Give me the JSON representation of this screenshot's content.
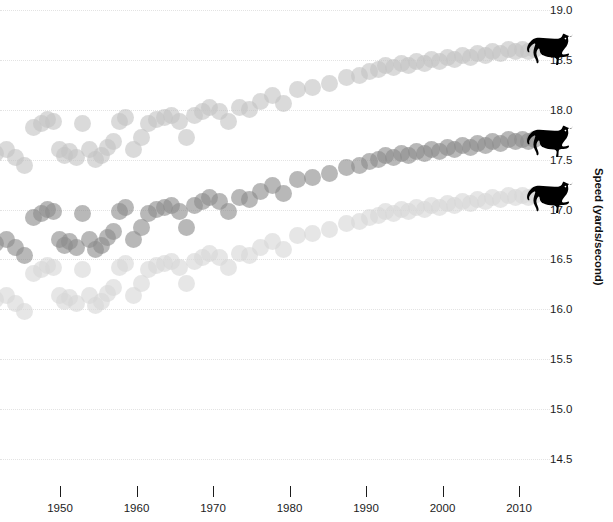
{
  "chart_data": {
    "type": "scatter",
    "title": "",
    "xlabel": "",
    "ylabel": "Speed (yards/second)",
    "xlim": [
      1940,
      2014
    ],
    "ylim": [
      14.25,
      19.1
    ],
    "grid": true,
    "legend_position": "none",
    "x_ticks": [
      1940,
      1950,
      1960,
      1970,
      1980,
      1990,
      2000,
      2010
    ],
    "x_tick_labels": [
      "0",
      "1950",
      "1960",
      "1970",
      "1980",
      "1990",
      "2000",
      "2010"
    ],
    "y_ticks": [
      19.0,
      18.5,
      18.0,
      17.5,
      17.0,
      16.5,
      16.0,
      15.5,
      15.0,
      14.5
    ],
    "y_tick_labels": [
      "19.0",
      "18.5",
      "18.0",
      "17.5",
      "17.0",
      "16.5",
      "16.0",
      "15.5",
      "15.0",
      "14.5"
    ],
    "marker_size_px": 17,
    "marker_opacity": 0.62,
    "series": [
      {
        "name": "upper",
        "color": "#c4c4c4",
        "marker_icon": "horse-icon",
        "marker_label_y": 18.52,
        "points": [
          [
            1939.2,
            17.78
          ],
          [
            1940.4,
            17.88
          ],
          [
            1941.6,
            17.56
          ],
          [
            1943.0,
            17.6
          ],
          [
            1944.2,
            17.52
          ],
          [
            1945.4,
            17.44
          ],
          [
            1946.6,
            17.82
          ],
          [
            1947.6,
            17.86
          ],
          [
            1948.4,
            17.9
          ],
          [
            1949.2,
            17.88
          ],
          [
            1949.9,
            17.6
          ],
          [
            1950.6,
            17.54
          ],
          [
            1951.3,
            17.58
          ],
          [
            1952.2,
            17.52
          ],
          [
            1953.0,
            17.86
          ],
          [
            1953.8,
            17.6
          ],
          [
            1954.6,
            17.5
          ],
          [
            1955.4,
            17.54
          ],
          [
            1956.2,
            17.62
          ],
          [
            1957.0,
            17.68
          ],
          [
            1957.8,
            17.88
          ],
          [
            1958.6,
            17.92
          ],
          [
            1959.6,
            17.6
          ],
          [
            1960.6,
            17.72
          ],
          [
            1961.6,
            17.86
          ],
          [
            1962.6,
            17.9
          ],
          [
            1963.6,
            17.92
          ],
          [
            1964.6,
            17.94
          ],
          [
            1965.6,
            17.88
          ],
          [
            1966.6,
            17.72
          ],
          [
            1967.6,
            17.94
          ],
          [
            1968.6,
            17.98
          ],
          [
            1969.6,
            18.02
          ],
          [
            1970.8,
            17.98
          ],
          [
            1972.0,
            17.88
          ],
          [
            1973.4,
            18.02
          ],
          [
            1974.8,
            18.0
          ],
          [
            1976.2,
            18.08
          ],
          [
            1977.8,
            18.14
          ],
          [
            1979.2,
            18.06
          ],
          [
            1981.0,
            18.2
          ],
          [
            1983.0,
            18.22
          ],
          [
            1985.2,
            18.26
          ],
          [
            1987.4,
            18.32
          ],
          [
            1989.2,
            18.34
          ],
          [
            1990.4,
            18.38
          ],
          [
            1991.6,
            18.4
          ],
          [
            1992.6,
            18.44
          ],
          [
            1993.6,
            18.42
          ],
          [
            1994.6,
            18.46
          ],
          [
            1995.6,
            18.44
          ],
          [
            1996.6,
            18.48
          ],
          [
            1997.6,
            18.46
          ],
          [
            1998.6,
            18.5
          ],
          [
            1999.6,
            18.48
          ],
          [
            2000.6,
            18.52
          ],
          [
            2001.6,
            18.5
          ],
          [
            2002.6,
            18.54
          ],
          [
            2003.6,
            18.52
          ],
          [
            2004.6,
            18.56
          ],
          [
            2005.6,
            18.54
          ],
          [
            2006.6,
            18.58
          ],
          [
            2007.6,
            18.56
          ],
          [
            2008.6,
            18.6
          ],
          [
            2009.6,
            18.58
          ],
          [
            2010.4,
            18.6
          ],
          [
            2011.2,
            18.58
          ],
          [
            2012.0,
            18.6
          ]
        ]
      },
      {
        "name": "middle",
        "color": "#8d8d8d",
        "marker_icon": "horse-icon",
        "marker_label_y": 17.6,
        "points": [
          [
            1939.2,
            16.88
          ],
          [
            1940.4,
            16.98
          ],
          [
            1941.6,
            16.66
          ],
          [
            1943.0,
            16.7
          ],
          [
            1944.2,
            16.62
          ],
          [
            1945.4,
            16.54
          ],
          [
            1946.6,
            16.92
          ],
          [
            1947.6,
            16.96
          ],
          [
            1948.4,
            17.0
          ],
          [
            1949.2,
            16.98
          ],
          [
            1949.9,
            16.7
          ],
          [
            1950.6,
            16.64
          ],
          [
            1951.3,
            16.68
          ],
          [
            1952.2,
            16.62
          ],
          [
            1953.0,
            16.96
          ],
          [
            1953.8,
            16.7
          ],
          [
            1954.6,
            16.6
          ],
          [
            1955.4,
            16.64
          ],
          [
            1956.2,
            16.72
          ],
          [
            1957.0,
            16.78
          ],
          [
            1957.8,
            16.98
          ],
          [
            1958.6,
            17.02
          ],
          [
            1959.6,
            16.7
          ],
          [
            1960.6,
            16.82
          ],
          [
            1961.6,
            16.96
          ],
          [
            1962.6,
            17.0
          ],
          [
            1963.6,
            17.02
          ],
          [
            1964.6,
            17.04
          ],
          [
            1965.6,
            16.98
          ],
          [
            1966.6,
            16.82
          ],
          [
            1967.6,
            17.04
          ],
          [
            1968.6,
            17.08
          ],
          [
            1969.6,
            17.12
          ],
          [
            1970.8,
            17.08
          ],
          [
            1972.0,
            16.98
          ],
          [
            1973.4,
            17.12
          ],
          [
            1974.8,
            17.1
          ],
          [
            1976.2,
            17.18
          ],
          [
            1977.8,
            17.24
          ],
          [
            1979.2,
            17.16
          ],
          [
            1981.0,
            17.3
          ],
          [
            1983.0,
            17.32
          ],
          [
            1985.2,
            17.36
          ],
          [
            1987.4,
            17.42
          ],
          [
            1989.2,
            17.44
          ],
          [
            1990.4,
            17.48
          ],
          [
            1991.6,
            17.5
          ],
          [
            1992.6,
            17.54
          ],
          [
            1993.6,
            17.52
          ],
          [
            1994.6,
            17.56
          ],
          [
            1995.6,
            17.54
          ],
          [
            1996.6,
            17.58
          ],
          [
            1997.6,
            17.56
          ],
          [
            1998.6,
            17.6
          ],
          [
            1999.6,
            17.58
          ],
          [
            2000.6,
            17.62
          ],
          [
            2001.6,
            17.6
          ],
          [
            2002.6,
            17.64
          ],
          [
            2003.6,
            17.62
          ],
          [
            2004.6,
            17.66
          ],
          [
            2005.6,
            17.64
          ],
          [
            2006.6,
            17.68
          ],
          [
            2007.6,
            17.66
          ],
          [
            2008.6,
            17.7
          ],
          [
            2009.6,
            17.68
          ],
          [
            2010.4,
            17.7
          ],
          [
            2011.2,
            17.68
          ],
          [
            2012.0,
            17.7
          ]
        ]
      },
      {
        "name": "lower",
        "color": "#d6d6d6",
        "marker_icon": "horse-icon",
        "marker_label_y": 17.04,
        "points": [
          [
            1939.2,
            16.32
          ],
          [
            1940.4,
            16.42
          ],
          [
            1941.6,
            16.1
          ],
          [
            1943.0,
            16.14
          ],
          [
            1944.2,
            16.06
          ],
          [
            1945.4,
            15.98
          ],
          [
            1946.6,
            16.36
          ],
          [
            1947.6,
            16.4
          ],
          [
            1948.4,
            16.44
          ],
          [
            1949.2,
            16.42
          ],
          [
            1949.9,
            16.14
          ],
          [
            1950.6,
            16.08
          ],
          [
            1951.3,
            16.12
          ],
          [
            1952.2,
            16.06
          ],
          [
            1953.0,
            16.4
          ],
          [
            1953.8,
            16.14
          ],
          [
            1954.6,
            16.04
          ],
          [
            1955.4,
            16.08
          ],
          [
            1956.2,
            16.16
          ],
          [
            1957.0,
            16.22
          ],
          [
            1957.8,
            16.42
          ],
          [
            1958.6,
            16.46
          ],
          [
            1959.6,
            16.14
          ],
          [
            1960.6,
            16.26
          ],
          [
            1961.6,
            16.4
          ],
          [
            1962.6,
            16.44
          ],
          [
            1963.6,
            16.46
          ],
          [
            1964.6,
            16.48
          ],
          [
            1965.6,
            16.42
          ],
          [
            1966.6,
            16.26
          ],
          [
            1967.6,
            16.48
          ],
          [
            1968.6,
            16.52
          ],
          [
            1969.6,
            16.56
          ],
          [
            1970.8,
            16.52
          ],
          [
            1972.0,
            16.42
          ],
          [
            1973.4,
            16.56
          ],
          [
            1974.8,
            16.54
          ],
          [
            1976.2,
            16.62
          ],
          [
            1977.8,
            16.68
          ],
          [
            1979.2,
            16.6
          ],
          [
            1981.0,
            16.74
          ],
          [
            1983.0,
            16.76
          ],
          [
            1985.2,
            16.8
          ],
          [
            1987.4,
            16.86
          ],
          [
            1989.2,
            16.88
          ],
          [
            1990.4,
            16.92
          ],
          [
            1991.6,
            16.94
          ],
          [
            1992.6,
            16.98
          ],
          [
            1993.6,
            16.96
          ],
          [
            1994.6,
            17.0
          ],
          [
            1995.6,
            16.98
          ],
          [
            1996.6,
            17.02
          ],
          [
            1997.6,
            17.0
          ],
          [
            1998.6,
            17.04
          ],
          [
            1999.6,
            17.02
          ],
          [
            2000.6,
            17.06
          ],
          [
            2001.6,
            17.04
          ],
          [
            2002.6,
            17.08
          ],
          [
            2003.6,
            17.06
          ],
          [
            2004.6,
            17.1
          ],
          [
            2005.6,
            17.08
          ],
          [
            2006.6,
            17.12
          ],
          [
            2007.6,
            17.1
          ],
          [
            2008.6,
            17.14
          ],
          [
            2009.6,
            17.12
          ],
          [
            2010.4,
            17.14
          ],
          [
            2011.2,
            17.12
          ],
          [
            2012.0,
            17.14
          ]
        ]
      }
    ]
  }
}
